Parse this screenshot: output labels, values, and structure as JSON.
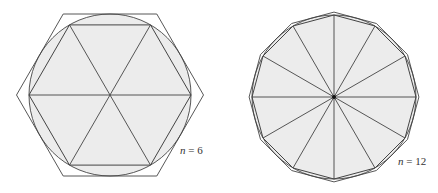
{
  "figures": [
    {
      "id": "hexagon",
      "n": 6,
      "label_var": "n",
      "label_eq": " = ",
      "label_val": "6",
      "center": [
        110,
        95
      ],
      "radius": 81
    },
    {
      "id": "dodecagon",
      "n": 12,
      "label_var": "n",
      "label_eq": " = ",
      "label_val": "12",
      "center": [
        334,
        97
      ],
      "radius": 82
    }
  ],
  "colors": {
    "fill": "#ececec",
    "stroke": "#444444"
  }
}
